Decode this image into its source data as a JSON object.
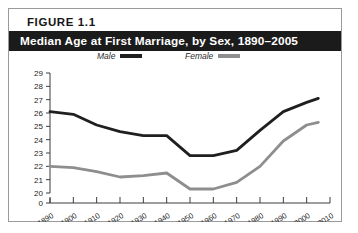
{
  "figure": {
    "label": "FIGURE  1.1",
    "title": "Median Age at First Marriage, by Sex, 1890–2005"
  },
  "legend": {
    "position": "top-inside",
    "entries": [
      {
        "label": "Male",
        "color": "#1f1f1f"
      },
      {
        "label": "Female",
        "color": "#8e8e8e"
      }
    ]
  },
  "colors": {
    "male_line": "#1f1f1f",
    "female_line": "#8e8e8e",
    "axis": "#3c3c3c",
    "title_bar_bg": "#1b1b1b",
    "title_bar_text": "#ffffff",
    "card_border": "#9a9a9a",
    "background": "#ffffff"
  },
  "axes": {
    "y_ticks": [
      "29",
      "28",
      "27",
      "26",
      "25",
      "24",
      "23",
      "22",
      "21",
      "20",
      "0"
    ],
    "y_broken": true,
    "y_min": 20,
    "y_max": 29,
    "x_ticks": [
      "1890",
      "1900",
      "1910",
      "1920",
      "1930",
      "1940",
      "1950",
      "1960",
      "1970",
      "1980",
      "1990",
      "2000",
      "2010"
    ]
  },
  "chart_data": {
    "type": "line",
    "title": "Median Age at First Marriage, by Sex, 1890–2005",
    "xlabel": "",
    "ylabel": "",
    "x": [
      1890,
      1900,
      1910,
      1920,
      1930,
      1940,
      1950,
      1960,
      1970,
      1980,
      1990,
      2000,
      2005
    ],
    "xlim": [
      1890,
      2010
    ],
    "ylim": [
      20,
      29
    ],
    "grid": false,
    "legend_position": "top",
    "series": [
      {
        "name": "Male",
        "color": "#1f1f1f",
        "values": [
          26.1,
          25.9,
          25.1,
          24.6,
          24.3,
          24.3,
          22.8,
          22.8,
          23.2,
          24.7,
          26.1,
          26.8,
          27.1
        ]
      },
      {
        "name": "Female",
        "color": "#8e8e8e",
        "values": [
          22.0,
          21.9,
          21.6,
          21.2,
          21.3,
          21.5,
          20.3,
          20.3,
          20.8,
          22.0,
          23.9,
          25.1,
          25.3
        ]
      }
    ]
  }
}
